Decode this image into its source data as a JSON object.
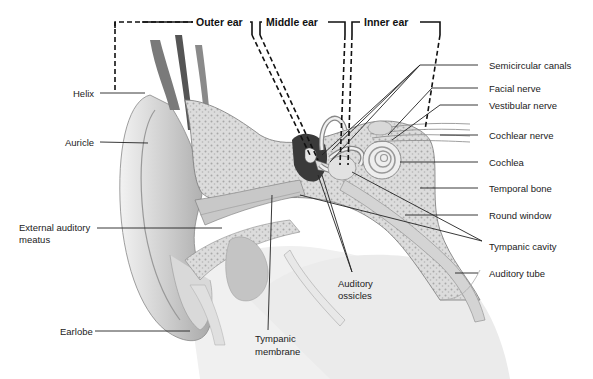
{
  "diagram": {
    "sections": [
      {
        "id": "outer",
        "label": "Outer ear"
      },
      {
        "id": "middle",
        "label": "Middle ear"
      },
      {
        "id": "inner",
        "label": "Inner ear"
      }
    ],
    "labels_left": [
      {
        "id": "helix",
        "text": "Helix"
      },
      {
        "id": "auricle",
        "text": "Auricle"
      },
      {
        "id": "external-auditory-meatus",
        "text": "External auditory\nmeatus",
        "line1": "External auditory",
        "line2": "meatus"
      },
      {
        "id": "earlobe",
        "text": "Earlobe"
      }
    ],
    "labels_bottom": [
      {
        "id": "tympanic-membrane",
        "line1": "Tympanic",
        "line2": "membrane"
      },
      {
        "id": "auditory-ossicles",
        "line1": "Auditory",
        "line2": "ossicles"
      }
    ],
    "labels_right": [
      {
        "id": "semicircular-canals",
        "text": "Semicircular canals"
      },
      {
        "id": "facial-nerve",
        "text": "Facial nerve"
      },
      {
        "id": "vestibular-nerve",
        "text": "Vestibular nerve"
      },
      {
        "id": "cochlear-nerve",
        "text": "Cochlear nerve"
      },
      {
        "id": "cochlea",
        "text": "Cochlea"
      },
      {
        "id": "temporal-bone",
        "text": "Temporal bone"
      },
      {
        "id": "round-window",
        "text": "Round window"
      },
      {
        "id": "tympanic-cavity",
        "text": "Tympanic cavity"
      },
      {
        "id": "auditory-tube",
        "text": "Auditory tube"
      }
    ]
  }
}
